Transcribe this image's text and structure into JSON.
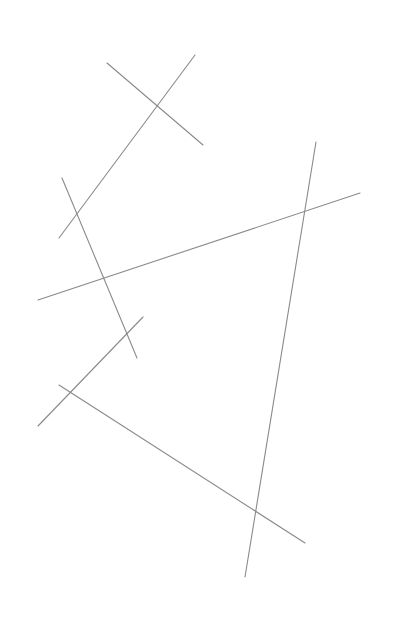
{
  "canvas": {
    "width": 399,
    "height": 629,
    "background": "#ffffff",
    "stroke_color": "#8a8a8a"
  },
  "segments": [
    {
      "id": "seg-1",
      "x1": 107,
      "y1": 63,
      "x2": 203,
      "y2": 145
    },
    {
      "id": "seg-2",
      "x1": 195,
      "y1": 55,
      "x2": 59,
      "y2": 238
    },
    {
      "id": "seg-3",
      "x1": 62,
      "y1": 178,
      "x2": 137,
      "y2": 358
    },
    {
      "id": "seg-4",
      "x1": 38,
      "y1": 300,
      "x2": 360,
      "y2": 193
    },
    {
      "id": "seg-5",
      "x1": 316,
      "y1": 142,
      "x2": 245,
      "y2": 577
    },
    {
      "id": "seg-6",
      "x1": 143,
      "y1": 317,
      "x2": 38,
      "y2": 426
    },
    {
      "id": "seg-7",
      "x1": 59,
      "y1": 385,
      "x2": 305,
      "y2": 543
    }
  ]
}
